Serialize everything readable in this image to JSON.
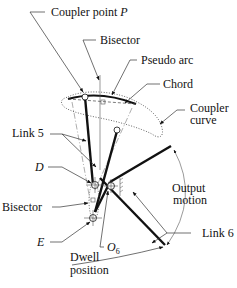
{
  "figure": {
    "labels": {
      "coupler_point": "Coupler point ",
      "coupler_point_var": "P",
      "bisector_top": "Bisector",
      "pseudo_arc": "Pseudo arc",
      "chord": "Chord",
      "coupler_curve_1": "Coupler",
      "coupler_curve_2": "curve",
      "link5": "Link 5",
      "d": "D",
      "bisector_left": "Bisector",
      "e": "E",
      "o6_main": "O",
      "o6_sub": "6",
      "output_motion_1": "Output",
      "output_motion_2": "motion",
      "link6": "Link 6",
      "dwell_1": "Dwell",
      "dwell_2": "position"
    }
  }
}
